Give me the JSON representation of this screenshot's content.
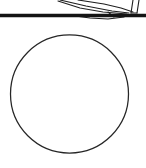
{
  "figure": {
    "title": "Cropped technical line drawing above a circle",
    "background_color": "#ffffff",
    "ink_color": "#1a1a1a",
    "width": 146,
    "height": 168,
    "caption": ""
  },
  "ground_rule": {
    "name": "horizontal ground line",
    "color": "#141414",
    "x1": 0,
    "y1": 15.5,
    "x2": 146,
    "y2": 15.5,
    "thickness": 3.4
  },
  "object_sketch": {
    "name": "cropped object outline",
    "color": "#1f1f1f",
    "stroke_width": 1.1,
    "strokes": [
      {
        "name": "upper-sweep-stroke",
        "points": "60,0 86,6 112,11 129,13"
      },
      {
        "name": "lower-sweep-stroke",
        "points": "78,0 104,4 121,8 133,12"
      },
      {
        "name": "long-diagonal-stroke",
        "points": "58,1 80,8 103,12 127,14"
      },
      {
        "name": "flare-under-stroke",
        "points": "68,15 90,18 108,19 124,17"
      },
      {
        "name": "short-tick-stroke",
        "points": "108,12 114,17"
      },
      {
        "name": "leg-left-stroke",
        "points": "133,0 131,13"
      },
      {
        "name": "leg-right-stroke",
        "points": "139,0 137,13"
      },
      {
        "name": "leg-foot-stroke",
        "points": "131,13 137,13"
      }
    ]
  },
  "circle": {
    "name": "large circle outline",
    "color": "#262626",
    "stroke_width": 1.25,
    "fill": "none",
    "center_x": 69.5,
    "center_y": 94,
    "radius": 59
  }
}
